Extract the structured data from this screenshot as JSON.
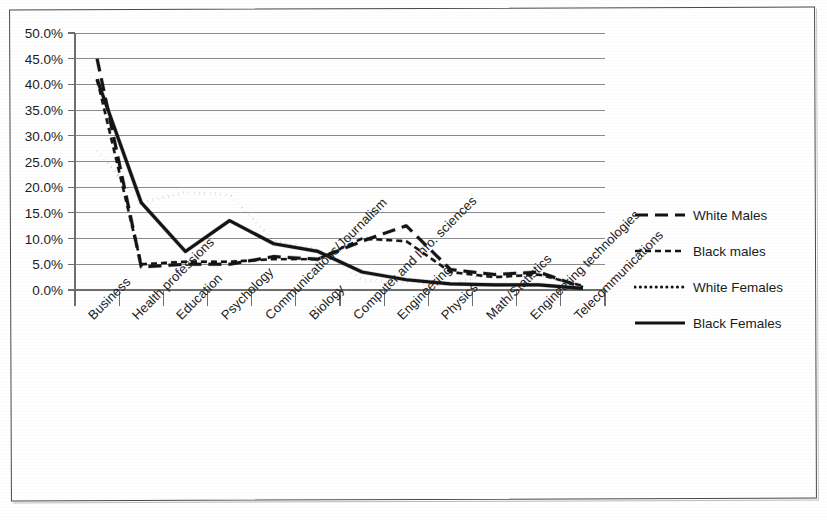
{
  "chart_data": {
    "type": "line",
    "title": "",
    "xlabel": "",
    "ylabel": "",
    "ylim": [
      0,
      50
    ],
    "ytick_labels": [
      "50.0%",
      "45.0%",
      "40.0%",
      "35.0%",
      "30.0%",
      "25.0%",
      "20.0%",
      "15.0%",
      "10.0%",
      "5.0%",
      "0.0%"
    ],
    "ytick_values": [
      50,
      45,
      40,
      35,
      30,
      25,
      20,
      15,
      10,
      5,
      0
    ],
    "grid": true,
    "legend_position": "right",
    "categories": [
      "Business",
      "Health professions",
      "Education",
      "Psychology",
      "Communications/Journalism",
      "Biology",
      "Computer and Info. sciences",
      "Engineering",
      "Physics",
      "Math/Statistics",
      "Engineering technologies",
      "Telecommunications"
    ],
    "series": [
      {
        "name": "White Males",
        "style": "long-dash",
        "values": [
          45.0,
          4.5,
          5.0,
          5.0,
          6.5,
          6.0,
          9.5,
          12.5,
          4.0,
          3.0,
          3.5,
          0.5
        ]
      },
      {
        "name": "Black males",
        "style": "short-dash",
        "values": [
          41.0,
          5.0,
          5.5,
          5.5,
          6.0,
          6.0,
          10.0,
          9.5,
          3.5,
          2.5,
          3.0,
          0.8
        ]
      },
      {
        "name": "White Females",
        "style": "dotted",
        "values": [
          27.0,
          17.0,
          19.0,
          18.5,
          9.5,
          8.0,
          2.0,
          1.5,
          1.0,
          3.5,
          3.0,
          0.5
        ]
      },
      {
        "name": "Black Females",
        "style": "solid",
        "values": [
          41.0,
          17.0,
          7.5,
          13.5,
          9.0,
          7.5,
          3.5,
          2.0,
          1.2,
          1.0,
          1.0,
          0.3
        ]
      }
    ]
  },
  "legend": {
    "entries": [
      {
        "label": "White Males",
        "style": "long-dash"
      },
      {
        "label": "Black males",
        "style": "short-dash"
      },
      {
        "label": "White Females",
        "style": "dotted"
      },
      {
        "label": "Black Females",
        "style": "solid"
      }
    ]
  },
  "colors": {
    "ink": "#141414",
    "grid": "#8c8c8c",
    "axis": "#6e6e6e",
    "frame": "#4a4a4a",
    "background": "#ffffff"
  }
}
